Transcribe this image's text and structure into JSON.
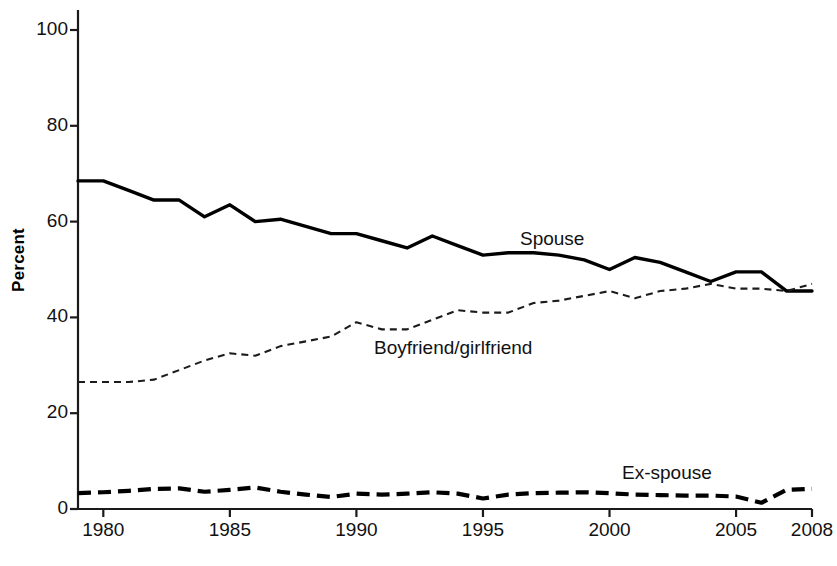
{
  "chart_data": {
    "type": "line",
    "title": "",
    "subtitle": "",
    "xlabel": "",
    "ylabel": "Percent",
    "xlim": [
      1979,
      2008
    ],
    "ylim": [
      0,
      100
    ],
    "grid": false,
    "legend_position": "inline-annotations",
    "x_tick_labels": [
      "1980",
      "1985",
      "1990",
      "1995",
      "2000",
      "2005",
      "2008"
    ],
    "x_ticks": [
      1980,
      1985,
      1990,
      1995,
      2000,
      2005,
      2008
    ],
    "y_tick_labels": [
      "0",
      "20",
      "40",
      "60",
      "80",
      "100"
    ],
    "y_ticks": [
      0,
      20,
      40,
      60,
      80,
      100
    ],
    "x": [
      1979,
      1980,
      1981,
      1982,
      1983,
      1984,
      1985,
      1986,
      1987,
      1988,
      1989,
      1990,
      1991,
      1992,
      1993,
      1994,
      1995,
      1996,
      1997,
      1998,
      1999,
      2000,
      2001,
      2002,
      2003,
      2004,
      2005,
      2006,
      2007,
      2008
    ],
    "series": [
      {
        "name": "Spouse",
        "style": "solid",
        "color": "#000000",
        "values": [
          68.5,
          68.5,
          66.5,
          64.5,
          64.5,
          61.0,
          63.5,
          60.0,
          60.5,
          59.0,
          57.5,
          57.5,
          56.0,
          54.5,
          57.0,
          55.0,
          53.0,
          53.5,
          53.5,
          53.0,
          52.0,
          50.0,
          52.5,
          51.5,
          49.5,
          47.5,
          49.5,
          49.5,
          45.5,
          45.5
        ]
      },
      {
        "name": "Boyfriend/girlfriend",
        "style": "dotted-dash",
        "color": "#000000",
        "values": [
          26.5,
          26.5,
          26.5,
          27.0,
          29.0,
          31.0,
          32.5,
          32.0,
          34.0,
          35.0,
          36.0,
          39.0,
          37.5,
          37.5,
          39.5,
          41.5,
          41.0,
          41.0,
          43.0,
          43.5,
          44.5,
          45.5,
          44.0,
          45.5,
          46.0,
          47.0,
          46.0,
          46.0,
          45.5,
          47.0
        ]
      },
      {
        "name": "Ex-spouse",
        "style": "dashed-bold",
        "color": "#000000",
        "values": [
          3.3,
          3.5,
          3.8,
          4.2,
          4.3,
          3.6,
          4.0,
          4.5,
          3.6,
          3.0,
          2.5,
          3.2,
          3.0,
          3.2,
          3.5,
          3.2,
          2.2,
          3.0,
          3.3,
          3.4,
          3.5,
          3.3,
          3.0,
          2.9,
          2.8,
          2.8,
          2.6,
          1.3,
          4.0,
          4.2
        ]
      }
    ],
    "annotations": [
      {
        "text": "Spouse",
        "x_px": 520,
        "y_px": 228
      },
      {
        "text": "Boyfriend/girlfriend",
        "x_px": 374,
        "y_px": 337
      },
      {
        "text": "Ex-spouse",
        "x_px": 622,
        "y_px": 462
      }
    ]
  },
  "axis": {
    "y_title": "Percent"
  }
}
